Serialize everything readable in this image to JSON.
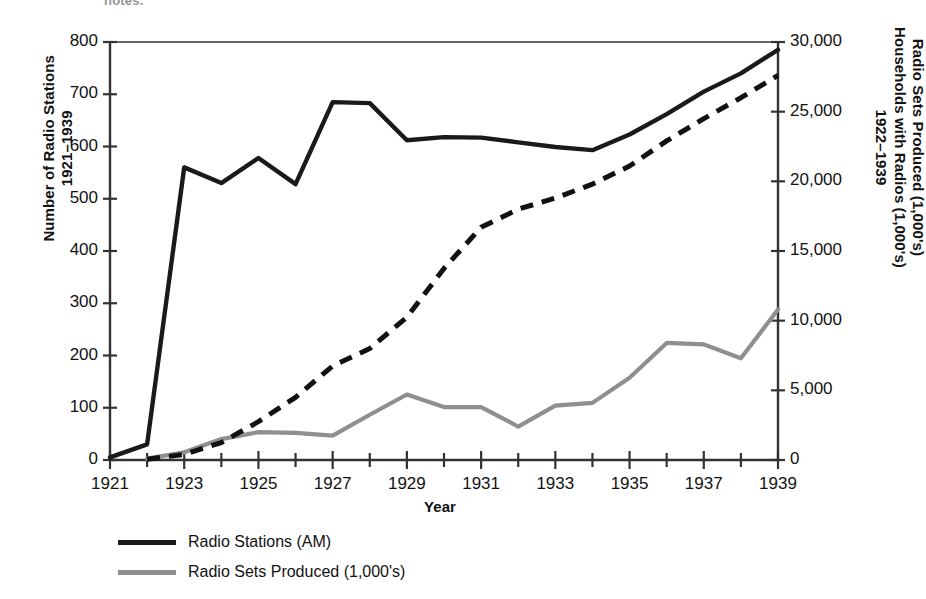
{
  "page": {
    "cut_top_text": "notes."
  },
  "axes": {
    "x_title": "Year",
    "y_left_title_line1": "Number of Radio Stations",
    "y_left_title_line2": "1921–1939",
    "y_right_title_line1": "Radio Sets Produced (1,000's)",
    "y_right_title_line2": "Households with Radios (1,000's)",
    "y_right_title_line3": "1922–1939",
    "x_ticks": [
      "1921",
      "1923",
      "1925",
      "1927",
      "1929",
      "1931",
      "1933",
      "1935",
      "1937",
      "1939"
    ],
    "y_left_ticks": [
      "0",
      "100",
      "200",
      "300",
      "400",
      "500",
      "600",
      "700",
      "800"
    ],
    "y_right_ticks": [
      "0",
      "5,000",
      "10,000",
      "15,000",
      "20,000",
      "25,000",
      "30,000"
    ]
  },
  "legend": {
    "items": [
      {
        "label": "Radio Stations (AM)",
        "color": "#1a1a1a",
        "style": "solid"
      },
      {
        "label": "Radio Sets Produced (1,000's)",
        "color": "#8f8f8f",
        "style": "solid"
      }
    ]
  },
  "colors": {
    "stations": "#1a1a1a",
    "households": "#111111",
    "sets": "#8f8f8f",
    "axis": "#333333"
  },
  "chart_data": {
    "type": "line",
    "title": "",
    "xlabel": "Year",
    "ylabel_left": "Number of Radio Stations 1921–1939",
    "ylabel_right": "Radio Sets Produced (1,000's) / Households with Radios (1,000's) 1922–1939",
    "grid": false,
    "legend_position": "bottom-left",
    "x": [
      1921,
      1922,
      1923,
      1924,
      1925,
      1926,
      1927,
      1928,
      1929,
      1930,
      1931,
      1932,
      1933,
      1934,
      1935,
      1936,
      1937,
      1938,
      1939
    ],
    "xlim": [
      1921,
      1939
    ],
    "ylim_left": [
      0,
      800
    ],
    "ylim_right": [
      0,
      30000
    ],
    "series": [
      {
        "name": "Radio Stations (AM)",
        "axis": "left",
        "style": "solid",
        "color": "#1a1a1a",
        "unit": "stations",
        "x": [
          1921,
          1922,
          1923,
          1924,
          1925,
          1926,
          1927,
          1928,
          1929,
          1930,
          1931,
          1932,
          1933,
          1934,
          1935,
          1936,
          1937,
          1938,
          1939
        ],
        "values": [
          5,
          30,
          560,
          530,
          578,
          528,
          685,
          683,
          612,
          618,
          617,
          608,
          599,
          593,
          623,
          662,
          705,
          740,
          785
        ]
      },
      {
        "name": "Households with Radios (1,000's)",
        "axis": "right",
        "style": "dashed",
        "color": "#111111",
        "unit": "thousands of households",
        "x": [
          1922,
          1923,
          1924,
          1925,
          1926,
          1927,
          1928,
          1929,
          1930,
          1931,
          1932,
          1933,
          1934,
          1935,
          1936,
          1937,
          1938,
          1939
        ],
        "values": [
          60,
          400,
          1250,
          2750,
          4500,
          6750,
          8000,
          10250,
          13750,
          16700,
          18000,
          18800,
          19800,
          21100,
          22900,
          24500,
          26000,
          27600
        ]
      },
      {
        "name": "Radio Sets Produced (1,000's)",
        "axis": "right",
        "style": "solid",
        "color": "#8f8f8f",
        "unit": "thousands of sets",
        "x": [
          1922,
          1923,
          1924,
          1925,
          1926,
          1927,
          1928,
          1929,
          1930,
          1931,
          1932,
          1933,
          1934,
          1935,
          1936,
          1937,
          1938,
          1939
        ],
        "values": [
          100,
          550,
          1500,
          2000,
          1950,
          1750,
          3250,
          4700,
          3800,
          3800,
          2400,
          3900,
          4100,
          5900,
          8400,
          8300,
          7300,
          10800
        ]
      }
    ]
  }
}
